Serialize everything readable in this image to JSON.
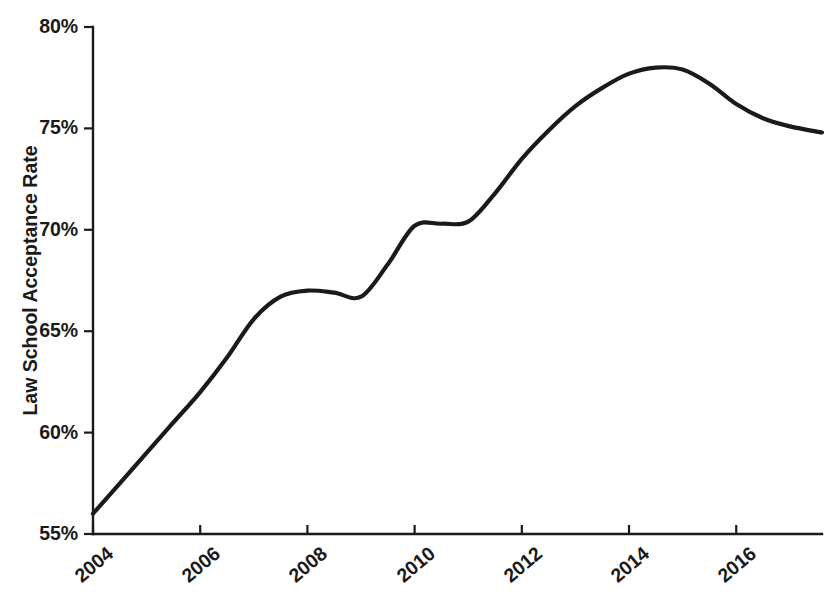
{
  "chart_data": {
    "type": "line",
    "title": "",
    "subtitle": "",
    "xlabel": "",
    "ylabel": "Law School Acceptance Rate",
    "xlim": [
      2004,
      2017.6
    ],
    "ylim": [
      55,
      80
    ],
    "grid": false,
    "legend": null,
    "line_color": "#1a1a1a",
    "axis_color": "#1a1a1a",
    "x_tick_labels": [
      "2004",
      "2006",
      "2008",
      "2010",
      "2012",
      "2014",
      "2016"
    ],
    "x_ticks": [
      2004,
      2006,
      2008,
      2010,
      2012,
      2014,
      2016
    ],
    "y_tick_labels": [
      "55%",
      "60%",
      "65%",
      "70%",
      "75%",
      "80%"
    ],
    "y_ticks": [
      55,
      60,
      65,
      70,
      75,
      80
    ],
    "series": [
      {
        "name": "Law School Acceptance Rate",
        "x": [
          2004,
          2004.5,
          2005,
          2005.5,
          2006,
          2006.5,
          2007,
          2007.5,
          2008,
          2008.5,
          2009,
          2009.5,
          2010,
          2010.5,
          2011,
          2011.5,
          2012,
          2012.5,
          2013,
          2013.5,
          2014,
          2014.5,
          2015,
          2015.5,
          2016,
          2016.5,
          2017,
          2017.6
        ],
        "y": [
          56.0,
          57.5,
          59.0,
          60.5,
          62.0,
          63.7,
          65.6,
          66.7,
          67.0,
          66.9,
          66.7,
          68.3,
          70.2,
          70.3,
          70.4,
          71.8,
          73.5,
          74.9,
          76.1,
          77.0,
          77.7,
          78.0,
          77.9,
          77.2,
          76.2,
          75.5,
          75.1,
          74.8
        ]
      }
    ]
  },
  "axes": {
    "y_axis_title": "Law School Acceptance Rate",
    "y_tick_0": "55%",
    "y_tick_1": "60%",
    "y_tick_2": "65%",
    "y_tick_3": "70%",
    "y_tick_4": "75%",
    "y_tick_5": "80%",
    "x_tick_0": "2004",
    "x_tick_1": "2006",
    "x_tick_2": "2008",
    "x_tick_3": "2010",
    "x_tick_4": "2012",
    "x_tick_5": "2014",
    "x_tick_6": "2016"
  }
}
